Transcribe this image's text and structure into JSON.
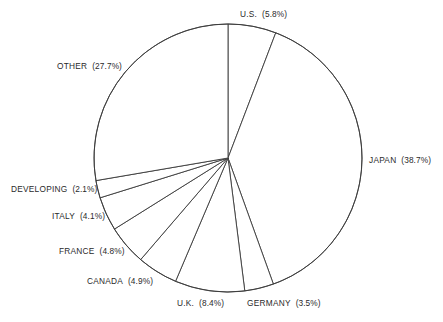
{
  "chart_data": {
    "type": "pie",
    "title": "",
    "subtitle": "",
    "xlabel": "",
    "ylabel": "",
    "legend_position": "none",
    "grid": false,
    "units": "percent",
    "start_angle_deg": 0,
    "direction": "clockwise",
    "center": {
      "x": 228,
      "y": 158
    },
    "radius": 134,
    "categories": [
      "U.S.",
      "JAPAN",
      "GERMANY",
      "U.K.",
      "CANADA",
      "FRANCE",
      "ITALY",
      "DEVELOPING",
      "OTHER"
    ],
    "values": [
      5.8,
      38.7,
      3.5,
      8.4,
      4.9,
      4.8,
      4.1,
      2.1,
      27.7
    ],
    "slices": [
      {
        "name": "U.S.",
        "value": 5.8,
        "pct_label": "(5.8%)",
        "label_text": "U.S.  (5.8%)",
        "label_x": 240,
        "label_y": 9,
        "label_align": "left"
      },
      {
        "name": "JAPAN",
        "value": 38.7,
        "pct_label": "(38.7%)",
        "label_text": "JAPAN  (38.7%)",
        "label_x": 369,
        "label_y": 155,
        "label_align": "left"
      },
      {
        "name": "GERMANY",
        "value": 3.5,
        "pct_label": "(3.5%)",
        "label_text": "GERMANY  (3.5%)",
        "label_x": 247,
        "label_y": 298,
        "label_align": "left"
      },
      {
        "name": "U.K.",
        "value": 8.4,
        "pct_label": "(8.4%)",
        "label_text": "U.K.  (8.4%)",
        "label_x": 177,
        "label_y": 298,
        "label_align": "left"
      },
      {
        "name": "CANADA",
        "value": 4.9,
        "pct_label": "(4.9%)",
        "label_text": "CANADA  (4.9%)",
        "label_x": 87,
        "label_y": 276,
        "label_align": "left"
      },
      {
        "name": "FRANCE",
        "value": 4.8,
        "pct_label": "(4.8%)",
        "label_text": "FRANCE  (4.8%)",
        "label_x": 59,
        "label_y": 246,
        "label_align": "left"
      },
      {
        "name": "ITALY",
        "value": 4.1,
        "pct_label": "(4.1%)",
        "label_text": "ITALY  (4.1%)",
        "label_x": 52,
        "label_y": 211,
        "label_align": "left"
      },
      {
        "name": "DEVELOPING",
        "value": 2.1,
        "pct_label": "(2.1%)",
        "label_text": "DEVELOPING  (2.1%)",
        "label_x": 11,
        "label_y": 184,
        "label_align": "left"
      },
      {
        "name": "OTHER",
        "value": 27.7,
        "pct_label": "(27.7%)",
        "label_text": "OTHER  (27.7%)",
        "label_x": 57,
        "label_y": 61,
        "label_align": "left"
      }
    ],
    "colors": {
      "slice_fill": "#ffffff",
      "slice_stroke": "#3b3b3b",
      "label_text": "#2a2a2a",
      "background": "#ffffff"
    }
  }
}
